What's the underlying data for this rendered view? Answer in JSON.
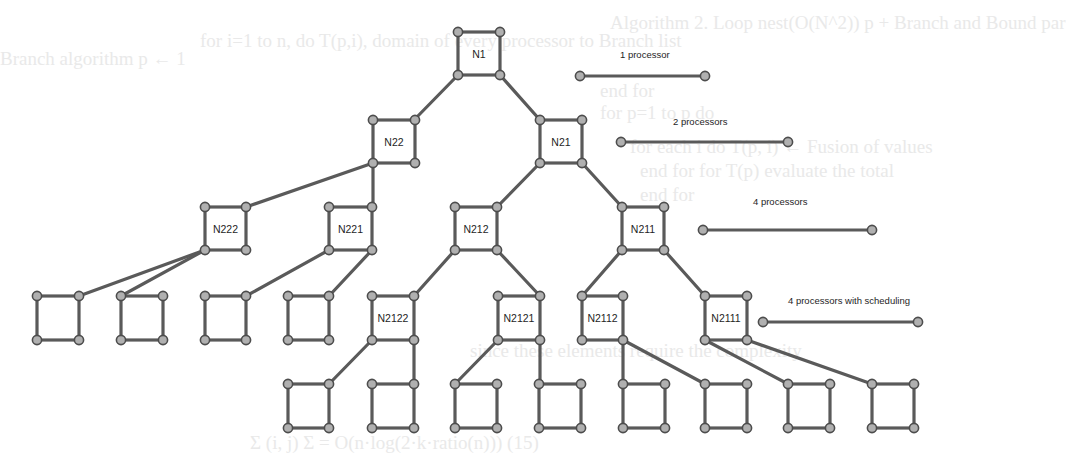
{
  "diagram": {
    "colors": {
      "edge": "#5a5a5a",
      "node_fill": "#b0b0b0",
      "node_stroke": "#4d4d4d",
      "text": "#1e1e1e",
      "ghost_text": "#e9e9e9"
    },
    "squares": [
      {
        "id": "N1",
        "label": "N1",
        "x": 458,
        "y": 32,
        "w": 42,
        "h": 43
      },
      {
        "id": "N22",
        "label": "N22",
        "x": 373,
        "y": 120,
        "w": 42,
        "h": 43
      },
      {
        "id": "N21",
        "label": "N21",
        "x": 540,
        "y": 120,
        "w": 42,
        "h": 43
      },
      {
        "id": "N222",
        "label": "N222",
        "x": 205,
        "y": 207,
        "w": 41,
        "h": 43
      },
      {
        "id": "N221",
        "label": "N221",
        "x": 329,
        "y": 207,
        "w": 43,
        "h": 43
      },
      {
        "id": "N212",
        "label": "N212",
        "x": 455,
        "y": 207,
        "w": 42,
        "h": 43
      },
      {
        "id": "N211",
        "label": "N211",
        "x": 622,
        "y": 207,
        "w": 42,
        "h": 43
      },
      {
        "id": "L1",
        "label": "",
        "x": 37,
        "y": 296,
        "w": 42,
        "h": 44
      },
      {
        "id": "L2",
        "label": "",
        "x": 121,
        "y": 296,
        "w": 42,
        "h": 44
      },
      {
        "id": "L3",
        "label": "",
        "x": 205,
        "y": 296,
        "w": 41,
        "h": 44
      },
      {
        "id": "L4",
        "label": "",
        "x": 288,
        "y": 296,
        "w": 41,
        "h": 44
      },
      {
        "id": "N2122",
        "label": "N2122",
        "x": 372,
        "y": 296,
        "w": 42,
        "h": 44
      },
      {
        "id": "N2121",
        "label": "N2121",
        "x": 498,
        "y": 296,
        "w": 42,
        "h": 44
      },
      {
        "id": "N2112",
        "label": "N2112",
        "x": 582,
        "y": 296,
        "w": 41,
        "h": 44
      },
      {
        "id": "N2111",
        "label": "N2111",
        "x": 705,
        "y": 296,
        "w": 42,
        "h": 44
      },
      {
        "id": "M1",
        "label": "",
        "x": 288,
        "y": 384,
        "w": 41,
        "h": 44
      },
      {
        "id": "M2",
        "label": "",
        "x": 372,
        "y": 384,
        "w": 42,
        "h": 44
      },
      {
        "id": "M3",
        "label": "",
        "x": 455,
        "y": 384,
        "w": 42,
        "h": 44
      },
      {
        "id": "M4",
        "label": "",
        "x": 539,
        "y": 384,
        "w": 42,
        "h": 44
      },
      {
        "id": "M5",
        "label": "",
        "x": 623,
        "y": 384,
        "w": 42,
        "h": 44
      },
      {
        "id": "M6",
        "label": "",
        "x": 705,
        "y": 384,
        "w": 42,
        "h": 44
      },
      {
        "id": "M7",
        "label": "",
        "x": 788,
        "y": 384,
        "w": 42,
        "h": 44
      },
      {
        "id": "M8",
        "label": "",
        "x": 872,
        "y": 384,
        "w": 42,
        "h": 44
      }
    ],
    "links": [
      [
        500,
        75,
        540,
        120
      ],
      [
        458,
        75,
        414,
        120
      ],
      [
        373,
        163,
        246,
        207
      ],
      [
        373,
        163,
        373,
        207
      ],
      [
        540,
        163,
        497,
        207
      ],
      [
        582,
        163,
        622,
        207
      ],
      [
        205,
        250,
        79,
        296
      ],
      [
        205,
        250,
        121,
        296
      ],
      [
        329,
        250,
        246,
        296
      ],
      [
        372,
        250,
        329,
        296
      ],
      [
        455,
        250,
        414,
        296
      ],
      [
        497,
        250,
        540,
        296
      ],
      [
        622,
        250,
        582,
        296
      ],
      [
        664,
        250,
        705,
        296
      ],
      [
        372,
        340,
        329,
        384
      ],
      [
        414,
        340,
        414,
        384
      ],
      [
        498,
        340,
        455,
        384
      ],
      [
        540,
        340,
        540,
        384
      ],
      [
        623,
        340,
        623,
        384
      ],
      [
        623,
        340,
        705,
        384
      ],
      [
        705,
        340,
        788,
        384
      ],
      [
        747,
        340,
        872,
        384
      ]
    ],
    "legend": [
      {
        "label": "1 processor",
        "label_x": 620,
        "label_y": 58,
        "x1": 580,
        "x2": 705,
        "y": 76
      },
      {
        "label": "2 processors",
        "label_x": 673,
        "label_y": 125,
        "x1": 621,
        "x2": 788,
        "y": 142
      },
      {
        "label": "4 processors",
        "label_x": 753,
        "label_y": 205,
        "x1": 703,
        "x2": 872,
        "y": 230
      },
      {
        "label": "4 processors with scheduling",
        "label_x": 788,
        "label_y": 304,
        "x1": 763,
        "x2": 918,
        "y": 322
      }
    ]
  },
  "background_text": [
    {
      "text": "Algorithm 2. Loop nest(O(N^2)) p + Branch and Bound par",
      "x": 610,
      "y": 28
    },
    {
      "text": "for i=1 to n, do T(p,i), domain of every processor to Branch list",
      "x": 200,
      "y": 46
    },
    {
      "text": "Branch algorithm p ← 1",
      "x": 0,
      "y": 64
    },
    {
      "text": "end for",
      "x": 600,
      "y": 96
    },
    {
      "text": "for p=1 to p do",
      "x": 600,
      "y": 118
    },
    {
      "text": "for each i do T(p, i) ← Fusion of values",
      "x": 630,
      "y": 152
    },
    {
      "text": "end for for T(p) evaluate the total",
      "x": 640,
      "y": 176
    },
    {
      "text": "end for",
      "x": 640,
      "y": 200
    },
    {
      "text": "since these elements require the complexity",
      "x": 470,
      "y": 356
    },
    {
      "text": "Σ (i, j) Σ  =  O(n·log(2·k·ratio(n)))   (15)",
      "x": 250,
      "y": 448
    }
  ]
}
